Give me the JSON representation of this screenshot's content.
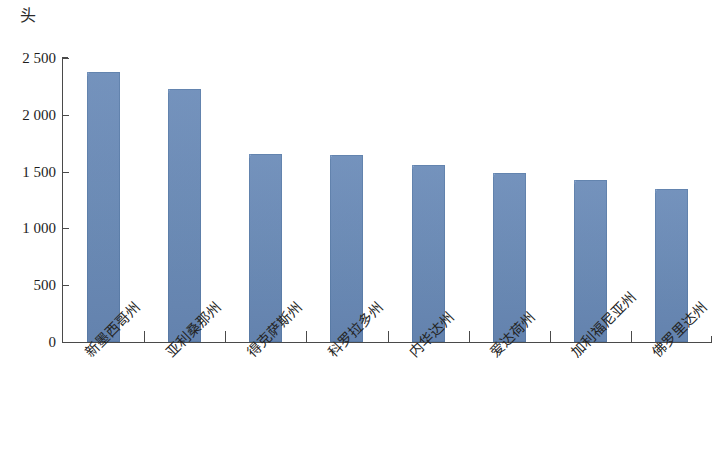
{
  "chart_data": {
    "type": "bar",
    "title": "",
    "subtitle": "",
    "xlabel": "",
    "ylabel": "头",
    "unit_label": "头",
    "categories": [
      "新墨西哥州",
      "亚利桑那州",
      "得克萨斯州",
      "科罗拉多州",
      "内华达州",
      "爱达荷州",
      "加利福尼亚州",
      "佛罗里达州"
    ],
    "values": [
      2380,
      2230,
      1655,
      1645,
      1560,
      1490,
      1430,
      1350
    ],
    "ylim": [
      0,
      2500
    ],
    "y_ticks": [
      0,
      500,
      1000,
      1500,
      2000,
      2500
    ],
    "y_tick_labels": [
      "0",
      "500",
      "1 000",
      "1 500",
      "2 000",
      "2 500"
    ],
    "grid": false,
    "legend": false,
    "legend_position": "none",
    "bar_color": "#6f92c2",
    "axis_color": "#4a4a4a",
    "background_color": "#ffffff",
    "x_tick_label_rotation": -45
  },
  "axis": {
    "unit": "头"
  }
}
